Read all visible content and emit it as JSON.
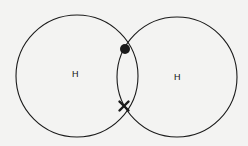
{
  "diagram": {
    "title": "",
    "atoms": [
      {
        "id": "left",
        "label": "H",
        "cx": 77,
        "cy": 76,
        "r": 61,
        "label_x": 72,
        "label_y": 70
      },
      {
        "id": "right",
        "label": "H",
        "cx": 177,
        "cy": 77,
        "r": 60,
        "label_x": 174,
        "label_y": 73
      }
    ],
    "shared_electrons": [
      {
        "type": "dot",
        "cx": 125,
        "cy": 49,
        "r": 5
      },
      {
        "type": "cross",
        "cx": 124,
        "cy": 106,
        "size": 5
      }
    ],
    "colors": {
      "stroke": "#1a1a1a",
      "background": "#f3f3f2"
    }
  }
}
